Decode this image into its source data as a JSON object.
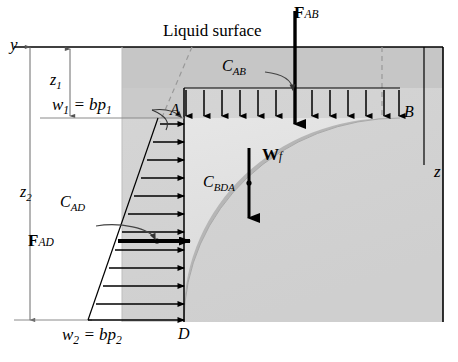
{
  "figure": {
    "type": "free-body-diagram",
    "labels": {
      "liquid_surface": "Liquid surface",
      "axis_y": "y",
      "axis_z": "z",
      "depth_1": "z",
      "depth_1_sub": "1",
      "depth_2": "z",
      "depth_2_sub": "2",
      "load_top": "w",
      "load_top_sub": "1",
      "load_top_eq": " = bp",
      "load_top_eq_sub": "1",
      "load_bottom": "w",
      "load_bottom_sub": "2",
      "load_bottom_eq": " = bp",
      "load_bottom_eq_sub": "2",
      "point_a": "A",
      "point_b": "B",
      "point_d": "D",
      "force_ab": "F",
      "force_ab_sub": "AB",
      "force_ad": "F",
      "force_ad_sub": "AD",
      "weight": "W",
      "weight_sub": "f",
      "centroid_ab": "C",
      "centroid_ab_sub": "AB",
      "centroid_ad": "C",
      "centroid_ad_sub": "AD",
      "centroid_bda": "C",
      "centroid_bda_sub": "BDA"
    },
    "colors": {
      "line": "#000000",
      "liquid_upper": "#c4c4c4",
      "liquid_body": "#dcdcdc",
      "arc_band": "#b4b4b4",
      "outer_block": "#d2d2d2",
      "dim_line": "#707070",
      "dashed": "#8a8a8a"
    },
    "geometry": {
      "surface_y": 47,
      "point_a": [
        184,
        118
      ],
      "point_b": [
        400,
        118
      ],
      "point_d": [
        184,
        322
      ],
      "frame_right": 443,
      "gray_left": 122,
      "load_arrow_count_ab": 13,
      "load_arrow_count_ad": 12
    }
  }
}
